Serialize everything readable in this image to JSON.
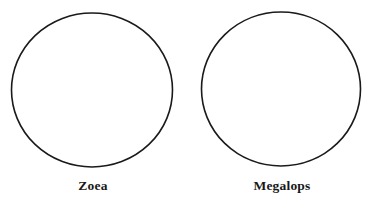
{
  "figure": {
    "background_color": "#ffffff",
    "outline_color": "#1a1a1a",
    "outline_width": 1.6,
    "panels": [
      {
        "id": "zoea",
        "label": "Zoea",
        "shape": "circle",
        "center_x": 92,
        "center_y": 90,
        "radius_x": 80.5,
        "radius_y": 77
      },
      {
        "id": "megalops",
        "label": "Megalops",
        "shape": "circle",
        "center_x": 92,
        "center_y": 89,
        "radius_x": 79.5,
        "radius_y": 77
      }
    ]
  }
}
